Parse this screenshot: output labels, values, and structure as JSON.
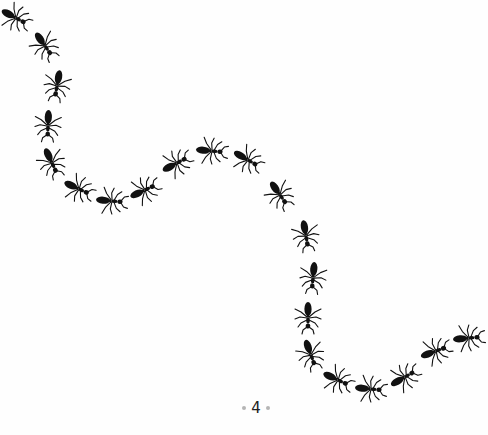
{
  "page": {
    "page_number": "4",
    "background": "#fefefe",
    "ink_color": "#111111",
    "ornament_color": "#b5b5b5"
  },
  "illustration": {
    "subject": "trail of ants",
    "direction_of_travel": "top-left to bottom-right",
    "ants": [
      {
        "x": 16,
        "y": 18,
        "angle": 28
      },
      {
        "x": 45,
        "y": 46,
        "angle": 55
      },
      {
        "x": 57,
        "y": 86,
        "angle": 100
      },
      {
        "x": 48,
        "y": 126,
        "angle": 92
      },
      {
        "x": 52,
        "y": 163,
        "angle": 65
      },
      {
        "x": 79,
        "y": 189,
        "angle": 25
      },
      {
        "x": 112,
        "y": 201,
        "angle": 5
      },
      {
        "x": 145,
        "y": 190,
        "angle": -25
      },
      {
        "x": 177,
        "y": 163,
        "angle": -28
      },
      {
        "x": 212,
        "y": 151,
        "angle": 5
      },
      {
        "x": 248,
        "y": 160,
        "angle": 30
      },
      {
        "x": 280,
        "y": 195,
        "angle": 55
      },
      {
        "x": 306,
        "y": 236,
        "angle": 80
      },
      {
        "x": 313,
        "y": 278,
        "angle": 95
      },
      {
        "x": 308,
        "y": 318,
        "angle": 90
      },
      {
        "x": 311,
        "y": 355,
        "angle": 70
      },
      {
        "x": 338,
        "y": 380,
        "angle": 25
      },
      {
        "x": 371,
        "y": 389,
        "angle": 5
      },
      {
        "x": 405,
        "y": 377,
        "angle": -30
      },
      {
        "x": 436,
        "y": 351,
        "angle": -20
      },
      {
        "x": 469,
        "y": 338,
        "angle": -5
      }
    ]
  }
}
